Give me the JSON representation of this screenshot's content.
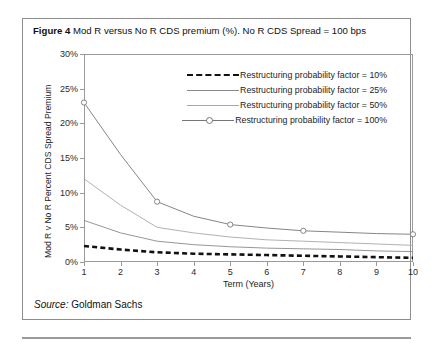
{
  "figure": {
    "label": "Figure 4",
    "caption": "Mod R versus No R CDS premium (%). No R CDS Spread = 100 bps",
    "source_label": "Source:",
    "source_value": "Goldman Sachs"
  },
  "chart_data": {
    "type": "line",
    "title": "Mod R versus No R CDS premium (%). No R CDS Spread = 100 bps",
    "xlabel": "Term (Years)",
    "ylabel": "Mod R v No R Percent CDS Spread Premium",
    "x": [
      1,
      2,
      3,
      4,
      5,
      6,
      7,
      8,
      9,
      10
    ],
    "xlim": [
      1,
      10
    ],
    "ylim": [
      0,
      30
    ],
    "xticklabels": [
      "1",
      "2",
      "3",
      "4",
      "5",
      "6",
      "7",
      "8",
      "9",
      "10"
    ],
    "yticklabels": [
      "0%",
      "5%",
      "10%",
      "15%",
      "20%",
      "25%",
      "30%"
    ],
    "ytickvalues": [
      0,
      5,
      10,
      15,
      20,
      25,
      30
    ],
    "grid": false,
    "legend_position": "top-right",
    "series": [
      {
        "name": "Restructuring probability factor = 10%",
        "style": "dashed",
        "color": "#111111",
        "marker": "none",
        "values": [
          2.3,
          1.8,
          1.4,
          1.2,
          1.1,
          1.0,
          0.9,
          0.8,
          0.7,
          0.6
        ]
      },
      {
        "name": "Restructuring probability factor = 25%",
        "style": "solid",
        "color": "#8a8a8a",
        "marker": "none",
        "values": [
          6.0,
          4.2,
          3.0,
          2.5,
          2.2,
          2.0,
          1.9,
          1.8,
          1.6,
          1.5
        ]
      },
      {
        "name": "Restructuring probability factor = 50%",
        "style": "solid",
        "color": "#a8a8a8",
        "marker": "none",
        "values": [
          12.0,
          8.2,
          5.0,
          4.2,
          3.6,
          3.2,
          3.0,
          2.8,
          2.6,
          2.4
        ]
      },
      {
        "name": "Restructuring probability factor = 100%",
        "style": "solid-marker",
        "color": "#777777",
        "marker": "circle",
        "marker_x": [
          1,
          3,
          5,
          7,
          10
        ],
        "values": [
          23.0,
          15.5,
          8.7,
          6.6,
          5.4,
          4.9,
          4.5,
          4.3,
          4.1,
          4.0
        ]
      }
    ]
  }
}
